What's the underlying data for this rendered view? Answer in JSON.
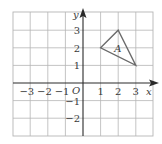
{
  "diagram": {
    "type": "coordinate-grid",
    "x_range": [
      -4,
      4
    ],
    "y_range": [
      -3,
      4
    ],
    "x_axis_label": "x",
    "y_axis_label": "y",
    "origin_label": "O",
    "x_ticks": [
      {
        "value": -3,
        "label": "−3"
      },
      {
        "value": -2,
        "label": "−2"
      },
      {
        "value": -1,
        "label": "−1"
      },
      {
        "value": 1,
        "label": "1"
      },
      {
        "value": 2,
        "label": "2"
      },
      {
        "value": 3,
        "label": "3"
      }
    ],
    "y_ticks": [
      {
        "value": 3,
        "label": "3"
      },
      {
        "value": 2,
        "label": "2"
      },
      {
        "value": 1,
        "label": "1"
      },
      {
        "value": -1,
        "label": "−1"
      },
      {
        "value": -2,
        "label": "−2"
      }
    ],
    "shapes": [
      {
        "name": "A",
        "label": "A",
        "vertices": [
          [
            1,
            2
          ],
          [
            2,
            3
          ],
          [
            3,
            1
          ]
        ],
        "label_position": [
          2,
          2
        ]
      }
    ],
    "colors": {
      "grid": "#b5b5b5",
      "axis": "#2a2a2a",
      "shape": "#6a6a6a",
      "text": "#3a3a3a"
    }
  }
}
